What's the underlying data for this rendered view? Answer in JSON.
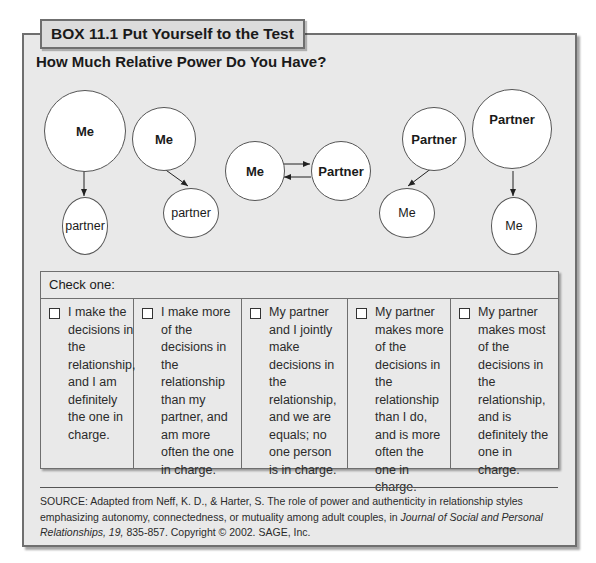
{
  "box": {
    "tab_label": "BOX 11.1 Put Yourself to the Test",
    "title": "How Much Relative Power Do You Have?"
  },
  "diagram": {
    "figures": [
      {
        "top_label": "Me",
        "bottom_label": "partner",
        "arrow": "down"
      },
      {
        "top_label": "Me",
        "bottom_label": "partner",
        "arrow": "down-right"
      },
      {
        "left_label": "Me",
        "right_label": "Partner",
        "arrow": "bidirectional"
      },
      {
        "top_label": "Partner",
        "bottom_label": "Me",
        "arrow": "down-left"
      },
      {
        "top_label": "Partner",
        "bottom_label": "Me",
        "arrow": "down"
      }
    ]
  },
  "check_table": {
    "header": "Check one:",
    "options": [
      {
        "text": "I make the decisions in the relationship, and I am definitely the one in charge."
      },
      {
        "text": "I make more of the decisions in the relationship than my partner, and am more often the one in charge."
      },
      {
        "text": "My partner and I jointly make decisions in the relationship, and we are equals; no one person is in charge."
      },
      {
        "text": "My partner makes more of the decisions in the relationship than I do, and is more often the one in charge."
      },
      {
        "text": "My partner makes most of the decisions in the relationship, and is definitely the one in charge."
      }
    ]
  },
  "source": {
    "prefix": "SOURCE: Adapted from Neff, K. D., & Harter, S. The role of power and authenticity in relationship styles emphasizing autonomy, connectedness, or mutuality among adult couples, in ",
    "journal": "Journal of Social and Personal Relationships, 19,",
    "suffix": " 835-857. Copyright © 2002. SAGE, Inc."
  }
}
